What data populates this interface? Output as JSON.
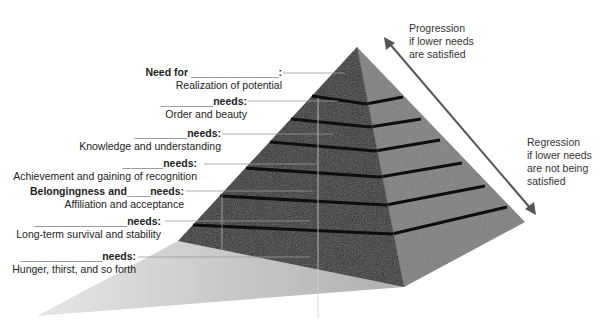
{
  "diagram": {
    "title_hidden": "",
    "levels": [
      {
        "head": "Need for _______________:",
        "sub": "Realization of potential"
      },
      {
        "head": "_________needs:",
        "sub": "Order and beauty"
      },
      {
        "head": "_________needs:",
        "sub": "Knowledge and understanding"
      },
      {
        "head": "_______needs:",
        "sub": "Achievement and gaining of recognition"
      },
      {
        "head": "Belongingness and____needs:",
        "sub": "Affiliation and acceptance"
      },
      {
        "head": "________________needs:",
        "sub": "Long-term survival and stability"
      },
      {
        "head": "______________needs:",
        "sub": "Hunger, thirst, and so forth"
      }
    ],
    "progression": {
      "line1": "Progression",
      "line2": "if lower needs",
      "line3": "are satisfied"
    },
    "regression": {
      "line1": "Regression",
      "line2": "if lower needs",
      "line3": "are not being",
      "line4": "satisfied"
    }
  },
  "colors": {
    "left_face": "#2a2a2a",
    "right_face": "#7a7a7a",
    "stripe": "#0e0e0e",
    "shadow": "#bdbdbd",
    "leader": "#9a9a9a",
    "arrow": "#555555"
  }
}
